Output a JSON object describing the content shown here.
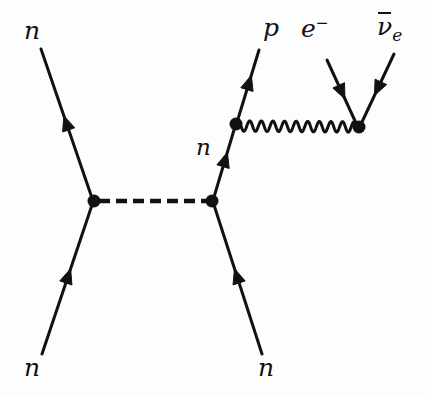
{
  "figure": {
    "kind": "feynman-diagram",
    "background_color": "#fdfdfd",
    "ink_color": "#111111",
    "width": 426,
    "height": 396
  },
  "labels": {
    "incoming_neutron_top": "n",
    "incoming_neutron_bottom_left": "n",
    "incoming_neutron_bottom_right": "n",
    "outgoing_proton": "p",
    "outgoing_electron_symbol": "e",
    "outgoing_electron_charge": "−",
    "outgoing_antineutrino_symbol": "ν",
    "outgoing_antineutrino_subscript": "e",
    "internal_neutron": "n"
  },
  "vertices": [
    {
      "id": "pion-vertex-left",
      "name": "pion-emission-vertex",
      "x": 94,
      "y": 201,
      "radius": 6.5
    },
    {
      "id": "pion-vertex-right",
      "name": "pion-absorption-vertex",
      "x": 212,
      "y": 201,
      "radius": 6.5
    },
    {
      "id": "w-vertex-left",
      "name": "w-emission-vertex",
      "x": 236,
      "y": 124,
      "radius": 6.5
    },
    {
      "id": "w-vertex-right",
      "name": "w-decay-vertex",
      "x": 359,
      "y": 127,
      "radius": 6.5
    }
  ],
  "propagators": {
    "pion": {
      "style": "dashed",
      "from": [
        99,
        201
      ],
      "to": [
        207,
        201
      ],
      "dash": "11 6",
      "stroke_width": 4.6
    },
    "w_boson": {
      "style": "wavy",
      "from": [
        241,
        126
      ],
      "to": [
        354,
        127
      ],
      "amplitude": 5.2,
      "wavelength": 11.6,
      "stroke_width": 3.0
    }
  },
  "fermion_lines": [
    {
      "name": "neutron-in-upper-left",
      "particle": "n",
      "from": [
        41,
        49
      ],
      "to": [
        92,
        198
      ],
      "arrow_at": 0.5,
      "arrow_direction": "toward-from",
      "stroke_width": 3.0
    },
    {
      "name": "neutron-in-lower-left",
      "particle": "n",
      "from": [
        42,
        354
      ],
      "to": [
        92,
        205
      ],
      "arrow_at": 0.52,
      "arrow_direction": "toward-to",
      "stroke_width": 3.0
    },
    {
      "name": "neutron-in-lower-right",
      "particle": "n",
      "from": [
        262,
        354
      ],
      "to": [
        214,
        205
      ],
      "arrow_at": 0.52,
      "arrow_direction": "toward-to",
      "stroke_width": 3.0
    },
    {
      "name": "neutron-internal",
      "particle": "n",
      "from": [
        214,
        197
      ],
      "to": [
        234,
        130
      ],
      "arrow_at": 0.55,
      "arrow_direction": "toward-to",
      "stroke_width": 3.0
    },
    {
      "name": "proton-out",
      "particle": "p",
      "from": [
        238,
        119
      ],
      "to": [
        259,
        50
      ],
      "arrow_at": 0.52,
      "arrow_direction": "toward-to",
      "stroke_width": 3.0
    },
    {
      "name": "electron-out",
      "particle": "e-",
      "from": [
        356,
        123
      ],
      "to": [
        327,
        60
      ],
      "arrow_at": 0.5,
      "arrow_direction": "toward-from",
      "stroke_width": 3.0
    },
    {
      "name": "antineutrino-out",
      "particle": "nubar-e",
      "from": [
        362,
        122
      ],
      "to": [
        394,
        54
      ],
      "arrow_at": 0.5,
      "arrow_direction": "toward-from",
      "stroke_width": 3.0
    }
  ]
}
